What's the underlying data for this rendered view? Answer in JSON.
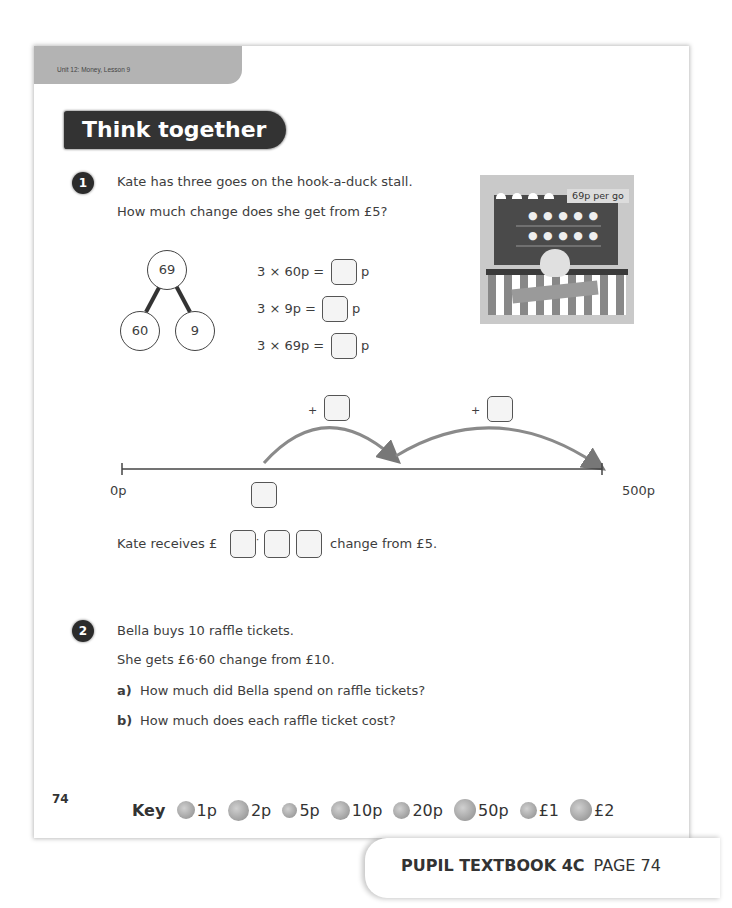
{
  "header": {
    "unit_label": "Unit 12: Money, Lesson 9",
    "section_title": "Think together"
  },
  "question1": {
    "number": "1",
    "line1": "Kate has three goes on the hook-a-duck stall.",
    "line2": "How much change does she get from £5?",
    "image": {
      "price_tag": "69p per go",
      "description": "hook-a-duck stall with ducks on shelves and striped base"
    },
    "part_whole": {
      "whole": "69",
      "part1": "60",
      "part2": "9"
    },
    "equations": [
      {
        "expr": "3 × 60p =",
        "unit": "p"
      },
      {
        "expr": "3 × 9p =",
        "unit": "p"
      },
      {
        "expr": "3 × 69p =",
        "unit": "p"
      }
    ],
    "number_line": {
      "start_label": "0p",
      "end_label": "500p",
      "jump1_prefix": "+",
      "jump2_prefix": "+"
    },
    "answer_line": {
      "prefix": "Kate receives £",
      "decimal_point": "·",
      "suffix": "change from £5."
    }
  },
  "question2": {
    "number": "2",
    "line1": "Bella buys 10 raffle tickets.",
    "line2": "She gets £6·60 change from £10.",
    "parts": [
      {
        "letter": "a)",
        "text": "How much did Bella spend on raffle tickets?"
      },
      {
        "letter": "b)",
        "text": "How much does each raffle ticket cost?"
      }
    ]
  },
  "footer": {
    "page_number": "74",
    "key_label": "Key",
    "coins": [
      {
        "icon": "coin-1p-icon",
        "label": "1p"
      },
      {
        "icon": "coin-2p-icon",
        "label": "2p"
      },
      {
        "icon": "coin-5p-icon",
        "label": "5p"
      },
      {
        "icon": "coin-10p-icon",
        "label": "10p"
      },
      {
        "icon": "coin-20p-icon",
        "label": "20p"
      },
      {
        "icon": "coin-50p-icon",
        "label": "50p"
      },
      {
        "icon": "coin-1-pound-icon",
        "label": "£1"
      },
      {
        "icon": "coin-2-pound-icon",
        "label": "£2"
      }
    ],
    "book_label": "PUPIL TEXTBOOK 4C",
    "page_label": "PAGE 74"
  }
}
